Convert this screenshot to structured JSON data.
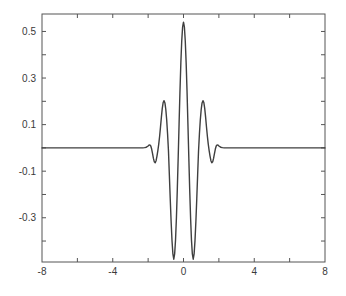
{
  "figure": {
    "background": "#ffffff",
    "axis_color": "#555555",
    "curve_color": "#3f3f3f",
    "label_color": "#3a3a3a",
    "curve_width": 1.4,
    "tick_length": 4
  },
  "chart_data": {
    "type": "line",
    "title": "",
    "xlabel": "",
    "ylabel": "",
    "xlim": [
      -8,
      8
    ],
    "ylim": [
      -0.49,
      0.575
    ],
    "grid": false,
    "legend": null,
    "box": true,
    "tick_direction": "in",
    "x_ticks": [
      -6,
      -4,
      -2,
      0,
      2,
      4,
      6
    ],
    "x_label_positions": [
      -8,
      -4,
      0,
      4,
      8
    ],
    "x_label_texts": [
      "-8",
      "-4",
      "0",
      "4",
      "8"
    ],
    "y_ticks": [
      0.5,
      0.4,
      0.3,
      0.2,
      0.1,
      0,
      -0.1,
      -0.2,
      -0.3,
      -0.4
    ],
    "y_label_positions": [
      0.5,
      0.3,
      0.1,
      -0.1,
      -0.3
    ],
    "y_label_texts": [
      "0.5",
      "0.3",
      "0.1",
      "-0.1",
      "-0.3"
    ],
    "key_points": [
      {
        "x": 0,
        "y": 0.54,
        "desc": "central peak"
      },
      {
        "x": -0.55,
        "y": -0.478,
        "desc": "left deep minimum"
      },
      {
        "x": 0.55,
        "y": -0.478,
        "desc": "right deep minimum"
      },
      {
        "x": -1.1,
        "y": 0.203,
        "desc": "left side lobe"
      },
      {
        "x": 1.1,
        "y": 0.203,
        "desc": "right side lobe"
      },
      {
        "x": -1.6,
        "y": -0.064,
        "desc": "left small dip"
      },
      {
        "x": 1.6,
        "y": -0.064,
        "desc": "right small dip"
      }
    ],
    "series": [
      {
        "name": "wavelet",
        "symmetric_even": true,
        "x_half": [
          0,
          0.05,
          0.1,
          0.15,
          0.2,
          0.25,
          0.3,
          0.35,
          0.4,
          0.45,
          0.5,
          0.55,
          0.6,
          0.65,
          0.7,
          0.75,
          0.8,
          0.85,
          0.9,
          0.95,
          1.0,
          1.05,
          1.1,
          1.15,
          1.2,
          1.25,
          1.3,
          1.35,
          1.4,
          1.45,
          1.5,
          1.55,
          1.6,
          1.65,
          1.7,
          1.75,
          1.8,
          1.85,
          1.9,
          1.95,
          2.0,
          2.1,
          2.2,
          2.3,
          2.5,
          3.0,
          8.0
        ],
        "y_half": [
          0.54,
          0.52,
          0.459,
          0.365,
          0.242,
          0.103,
          -0.041,
          -0.178,
          -0.3,
          -0.395,
          -0.455,
          -0.478,
          -0.455,
          -0.398,
          -0.316,
          -0.218,
          -0.115,
          -0.013,
          0.06,
          0.12,
          0.165,
          0.193,
          0.203,
          0.195,
          0.17,
          0.132,
          0.09,
          0.05,
          0.016,
          -0.012,
          -0.035,
          -0.055,
          -0.064,
          -0.06,
          -0.045,
          -0.025,
          -0.005,
          0.008,
          0.013,
          0.012,
          0.008,
          0.003,
          0.001,
          0.0,
          0.0,
          0.0,
          0.0
        ]
      }
    ]
  }
}
